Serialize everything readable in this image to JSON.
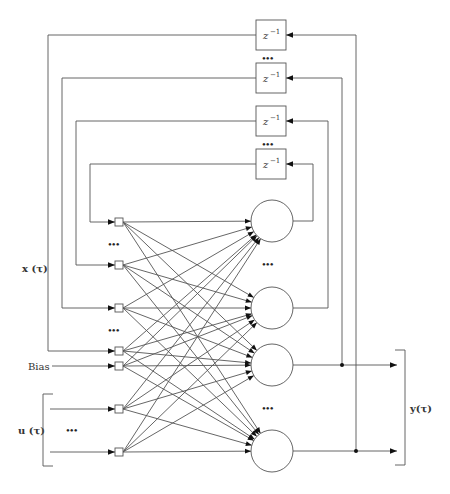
{
  "diagram": {
    "delay_label": "z",
    "delay_exponent": "−1",
    "ellipsis": "•••",
    "labels": {
      "state_input": "x (τ)",
      "bias": "Bias",
      "external_input": "u (τ)",
      "output": "y(τ)"
    },
    "delay_units": [
      {
        "id": "delay-1",
        "label": "z^-1"
      },
      {
        "id": "delay-2",
        "label": "z^-1"
      },
      {
        "id": "delay-3",
        "label": "z^-1"
      },
      {
        "id": "delay-4",
        "label": "z^-1"
      }
    ],
    "input_nodes": [
      {
        "id": "x-1",
        "group": "state"
      },
      {
        "id": "x-2",
        "group": "state"
      },
      {
        "id": "x-3",
        "group": "state"
      },
      {
        "id": "x-4",
        "group": "state"
      },
      {
        "id": "bias",
        "group": "bias"
      },
      {
        "id": "u-1",
        "group": "external"
      },
      {
        "id": "u-2",
        "group": "external"
      }
    ],
    "neurons": [
      {
        "id": "neuron-1",
        "feeds_delay": "delay-4",
        "is_output": false
      },
      {
        "id": "neuron-2",
        "feeds_delay": "delay-3",
        "is_output": false
      },
      {
        "id": "neuron-3",
        "feeds_delay": "delay-2",
        "is_output": true
      },
      {
        "id": "neuron-4",
        "feeds_delay": "delay-1",
        "is_output": true
      }
    ],
    "connections": "fully-connected: every input node to every neuron"
  }
}
